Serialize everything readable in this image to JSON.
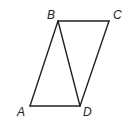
{
  "diagram": {
    "type": "parallelogram-with-diagonal",
    "stroke_color": "#222222",
    "background": "#ffffff",
    "vertices": {
      "A": {
        "label": "A",
        "x": 30,
        "y": 106
      },
      "B": {
        "label": "B",
        "x": 58,
        "y": 21
      },
      "C": {
        "label": "C",
        "x": 109,
        "y": 21
      },
      "D": {
        "label": "D",
        "x": 80,
        "y": 106
      }
    },
    "edges": [
      [
        "A",
        "B"
      ],
      [
        "B",
        "C"
      ],
      [
        "C",
        "D"
      ],
      [
        "D",
        "A"
      ],
      [
        "B",
        "D"
      ]
    ]
  }
}
